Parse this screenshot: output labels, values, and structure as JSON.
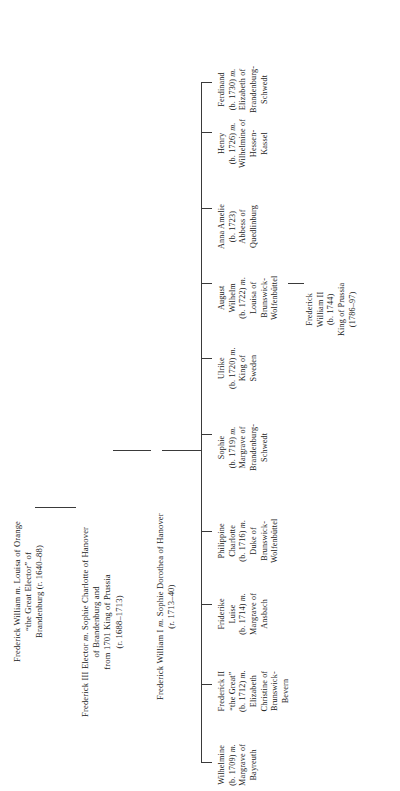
{
  "chart_data": {
    "type": "diagram",
    "orientation": "rotated-90-ccw",
    "generations": [
      {
        "id": "gen1",
        "nodes": [
          {
            "id": "frederick-william-great-elector",
            "lines": [
              "Frederick William <i>m.</i> Louisa of Orange",
              "“the Great Elector” of",
              "Brandenburg (r. 1640–88)"
            ]
          }
        ]
      },
      {
        "id": "gen2",
        "nodes": [
          {
            "id": "frederick-iii-elector",
            "lines": [
              "Frederick III Elector <i>m.</i> Sophie Charlotte of Hanover",
              "of Brandenburg and",
              "from 1701 King of Prussia",
              "(r. 1688–1713)"
            ]
          }
        ]
      },
      {
        "id": "gen3",
        "nodes": [
          {
            "id": "frederick-william-i",
            "lines": [
              "Frederick William I <i>m.</i> Sophie Dorothea of Hanover",
              "(r. 1713–40)"
            ]
          }
        ]
      },
      {
        "id": "gen4",
        "nodes": [
          {
            "id": "wilhelmine",
            "lines": [
              "Wilhelmine",
              "(b. 1709) <i>m.</i>",
              "Margrave of",
              "Bayreuth"
            ]
          },
          {
            "id": "frederick-ii",
            "lines": [
              "Frederick II",
              "“the Great”",
              "(b. 1712) <i>m.</i>",
              "Elizabeth",
              "Christine of",
              "Brunswick-",
              "Bevern"
            ]
          },
          {
            "id": "friderike-luise",
            "lines": [
              "Friderike",
              "Luise",
              "(b. 1714) <i>m.</i>",
              "Margrave of",
              "Ansbach"
            ]
          },
          {
            "id": "philippine-charlotte",
            "lines": [
              "Philippine",
              "Charlotte",
              "(b. 1716) <i>m.</i>",
              "Duke of",
              "Brunswick-",
              "Wolfenbüttel"
            ]
          },
          {
            "id": "sophie",
            "lines": [
              "Sophie",
              "(b. 1719) <i>m.</i>",
              "Margrave of",
              "Brandenburg-",
              "Schwedt"
            ]
          },
          {
            "id": "ulrike",
            "lines": [
              "Ulrike",
              "(b. 1720) <i>m.</i>",
              "King of",
              "Sweden"
            ]
          },
          {
            "id": "august-wilhelm",
            "lines": [
              "August",
              "Wilhelm",
              "(b. 1722) <i>m.</i>",
              "Louisa of",
              "Brunswick-",
              "Wolfenbüttel"
            ]
          },
          {
            "id": "anna-amelie",
            "lines": [
              "Anna Amelie",
              "(b. 1723)",
              "Abbess of",
              "Quedlinburg"
            ]
          },
          {
            "id": "henry",
            "lines": [
              "Henry",
              "(b. 1726) <i>m.</i>",
              "Wilhelmine of",
              "Hessen-",
              "Kassel"
            ]
          },
          {
            "id": "ferdinand",
            "lines": [
              "Ferdinand",
              "(b. 1730) <i>m.</i>",
              "Elizabeth of",
              "Brandenburg-",
              "Schwedt"
            ]
          }
        ]
      },
      {
        "id": "gen5",
        "nodes": [
          {
            "id": "frederick-william-ii",
            "lines": [
              "Frederick",
              "William II",
              "(b. 1744)",
              "King of Prussia",
              "(1786–97)"
            ]
          }
        ]
      }
    ],
    "colors": {
      "background": "#ffffff",
      "text": "#1a1a1a",
      "rule": "#3a3a3a"
    }
  }
}
